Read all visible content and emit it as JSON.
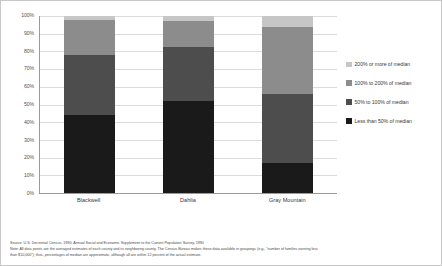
{
  "chart_data": {
    "type": "bar",
    "subtype": "stacked-100-percent",
    "title": "",
    "xlabel": "",
    "ylabel": "",
    "ylim": [
      0,
      100
    ],
    "y_tick_format": "percent",
    "grid": true,
    "legend_position": "right",
    "categories": [
      "Blackwell",
      "Dahlia",
      "Gray Mountain"
    ],
    "y_ticks": [
      "0%",
      "10%",
      "20%",
      "30%",
      "40%",
      "50%",
      "60%",
      "70%",
      "80%",
      "90%",
      "100%"
    ],
    "y_tick_values": [
      0,
      10,
      20,
      30,
      40,
      50,
      60,
      70,
      80,
      90,
      100
    ],
    "series": [
      {
        "name": "Less than 50% of median",
        "color": "#1a1a1a",
        "values": [
          44,
          52,
          17
        ]
      },
      {
        "name": "50% to 100% of median",
        "color": "#4d4d4d",
        "values": [
          34,
          30.5,
          39
        ]
      },
      {
        "name": "100% to 200% of median",
        "color": "#8c8c8c",
        "values": [
          20,
          14.5,
          38
        ]
      },
      {
        "name": "200% or more of median",
        "color": "#c6c6c6",
        "values": [
          2,
          3,
          6
        ]
      }
    ]
  },
  "legend": {
    "items": [
      {
        "label": "200% or more of median",
        "color": "#c6c6c6"
      },
      {
        "label": "100% to 200% of median",
        "color": "#8c8c8c"
      },
      {
        "label": "50% to 100% of median",
        "color": "#4d4d4d"
      },
      {
        "label": "Less than 50% of median",
        "color": "#1a1a1a"
      }
    ]
  },
  "footnotes": {
    "lines": [
      "Source: U.S. Decennial Census, 1990; Annual Social and Economic Supplement to the Current Population Survey, 1990",
      "Note: All data points are the averaged estimates of each county and its neighboring county. The Census Bureau makes these data available in groupings (e.g., \"number of families earning less",
      "than $10,000\"); thus, percentages of median are approximate, although all are within 12 percent of the actual estimate."
    ]
  }
}
